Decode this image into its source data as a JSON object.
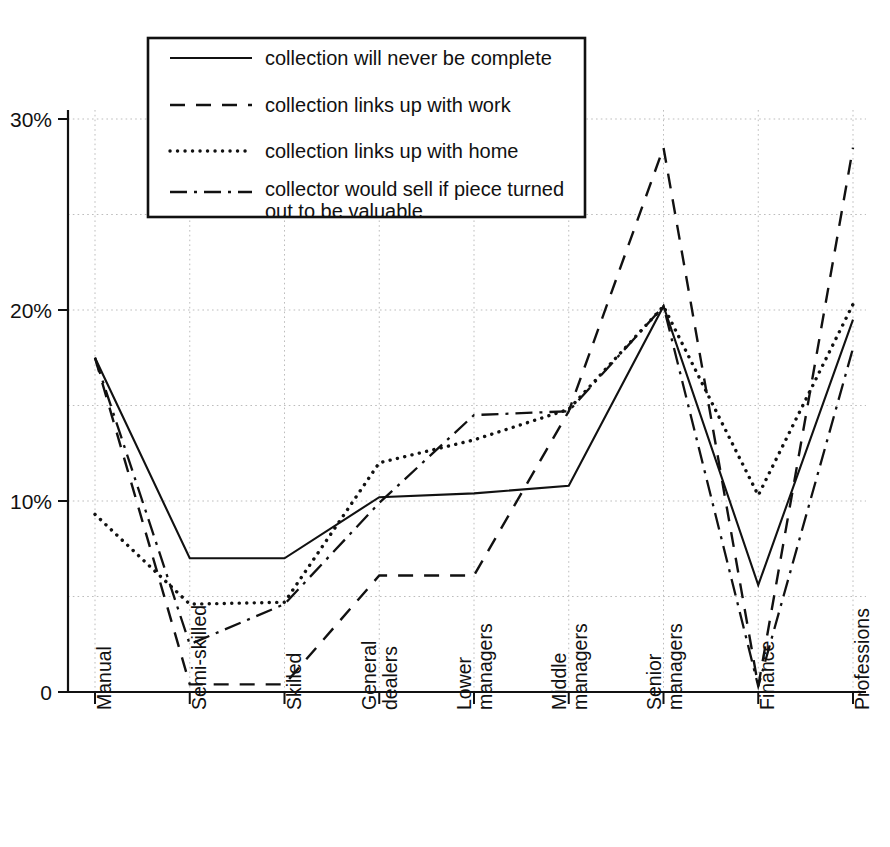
{
  "chart_data": {
    "type": "line",
    "title": "",
    "xlabel": "",
    "ylabel": "",
    "ylim": [
      0,
      31
    ],
    "yticks": [
      0,
      10,
      20,
      30
    ],
    "ytick_labels": [
      "0",
      "10%",
      "20%",
      "30%"
    ],
    "minor_gridlines": [
      5,
      15,
      25
    ],
    "grid": true,
    "legend_position": "top-left-inside",
    "categories": [
      "Manual",
      "Semi-skilled",
      "Skilled",
      "General dealers",
      "Lower managers",
      "Middle managers",
      "Senior managers",
      "Finance",
      "Professions"
    ],
    "series": [
      {
        "name": "collection will never be complete",
        "style": "solid",
        "values": [
          17.5,
          7.0,
          7.0,
          10.2,
          10.4,
          10.8,
          20.2,
          5.6,
          19.5
        ]
      },
      {
        "name": "collection links up with work",
        "style": "dashed",
        "values": [
          17.5,
          0.4,
          0.4,
          6.1,
          6.1,
          14.7,
          28.5,
          0.3,
          28.5
        ]
      },
      {
        "name": "collection links up with home",
        "style": "dotted",
        "values": [
          9.3,
          4.6,
          4.7,
          12.0,
          13.2,
          14.8,
          20.2,
          10.3,
          20.3
        ]
      },
      {
        "name": "collector would sell if piece turned out to be valuable",
        "style": "dashdot",
        "values": [
          17.5,
          2.5,
          4.6,
          9.9,
          14.5,
          14.7,
          20.2,
          0.3,
          18.0
        ]
      }
    ]
  },
  "legend": {
    "entries": [
      {
        "label": "collection will never be complete",
        "style": "solid"
      },
      {
        "label": "collection links up with work",
        "style": "dashed"
      },
      {
        "label": "collection links up with home",
        "style": "dotted"
      },
      {
        "label": "collector would sell if piece turned",
        "style": "dashdot"
      },
      {
        "label": "out to be valuable",
        "style": "continuation"
      }
    ]
  }
}
